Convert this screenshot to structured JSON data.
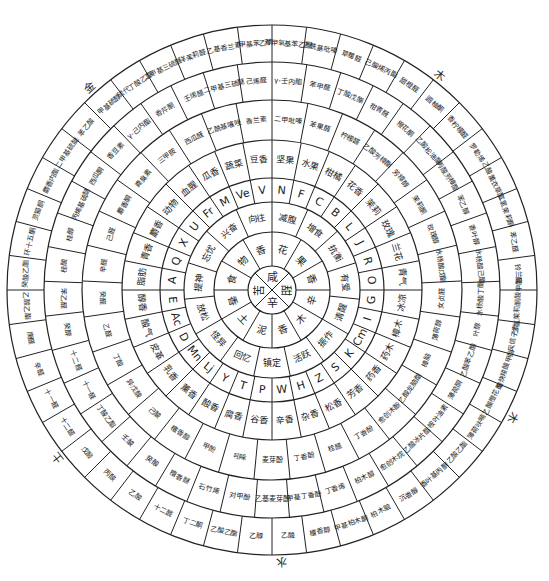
{
  "diagram": {
    "title": "",
    "center": {
      "x": 272,
      "y": 290
    },
    "outer_radius": 265,
    "elements": [
      {
        "label": "木",
        "angle": 38
      },
      {
        "label": "木",
        "angle": 118
      },
      {
        "label": "水",
        "angle": 178
      },
      {
        "label": "土",
        "angle": 232
      },
      {
        "label": "金",
        "angle": 318
      }
    ],
    "ring0_center": [
      "甜",
      "辛",
      "苦",
      "咸"
    ],
    "ring1_categories": [
      "花",
      "果",
      "香",
      "辛",
      "木",
      "香",
      "泥",
      "土",
      "香",
      "食",
      "物",
      "香"
    ],
    "ring2_subcategories": [
      "减腹",
      "增食",
      "抗衡",
      "有爱",
      "清醒",
      "振作",
      "活跃",
      "镇定",
      "回忆",
      "怪异",
      "放松",
      "提神",
      "忘忧",
      "兴奋",
      "向往"
    ],
    "ring3_letters": [
      "N",
      "F",
      "C",
      "B",
      "L",
      "J",
      "R",
      "O",
      "G",
      "I",
      "Cm",
      "K",
      "S",
      "Z",
      "H",
      "W",
      "P",
      "T",
      "Y",
      "Lj",
      "Mn",
      "D",
      "Ac",
      "E",
      "A",
      "Q",
      "X",
      "U",
      "Fr",
      "M",
      "Ve",
      "V"
    ],
    "ring4_groups": [
      "坚果",
      "水果",
      "柑橘",
      "花香",
      "茉莉",
      "玫瑰",
      "兰花",
      "青气",
      "冰凉",
      "樟木",
      "药木",
      "药香",
      "芳香",
      "松香",
      "杂香",
      "辛香",
      "谷香",
      "腐香",
      "酸香",
      "薰香",
      "乳香",
      "皮革",
      "酸气",
      "醇香",
      "脂肪",
      "青香",
      "麝香",
      "动物",
      "血腥",
      "瓜香",
      "蔬菜",
      "豆香"
    ],
    "ring5_compounds": [
      "二甲吡嗪",
      "苯果醛",
      "柠檬醛",
      "乙酸芳樟酯",
      "芳樟醇",
      "茉莉酮",
      "玫瑰醇",
      "水杨酸戊酯",
      "女贞醛",
      "薄荷醇",
      "樟脑",
      "乙酸龙脑酯",
      "愈创木酚",
      "丁香酚",
      "桂醛",
      "丁香酚",
      "麦芽酚",
      "吲哚",
      "甲酚",
      "檀香醇",
      "己酸",
      "异戊酸",
      "丁酸",
      "乙醛",
      "癸醛",
      "辛醛",
      "己醛",
      "麝香酮",
      "粪臭素",
      "三甲胺",
      "西瓜醛",
      "乙酰基噻唑",
      "香兰素"
    ],
    "ring6_compounds": [
      "γ-壬内酯",
      "苯甲醛",
      "丁酸戊酯",
      "柑青醛",
      "橙花酮",
      "乙酸松油酯",
      "丙酸芳樟酯",
      "苯乙醇",
      "香叶醇",
      "水杨酸己酯",
      "水杨酸丁酯",
      "叶醇",
      "乙酸苯乙酯",
      "薄荷酮",
      "桉叶油素",
      "乙酸冰片酯",
      "愈创木烷",
      "柏木醇",
      "丁香烯",
      "甲基丁香酚",
      "乙基麦芽酚",
      "对甲酚",
      "石竹烯",
      "檀香醚",
      "癸酸",
      "壬酸",
      "丁酸乙酯",
      "十一醛",
      "十二醛",
      "癸醇",
      "苯乙醛",
      "桂酸",
      "桂醇",
      "丙烯基硫醚",
      "西瓜酮",
      "香豆素",
      "γ-己内酯",
      "香芹酮",
      "壬烯醛",
      "二甲基三硫醚",
      "己烯醛"
    ],
    "ring7_compounds": [
      "对甲氧基苯乙酮",
      "乙酰基吡嗪",
      "草莓醛",
      "己酸烯丙酯",
      "甜橙醛",
      "圆柚酮",
      "香柠檬醛",
      "罗勒烯",
      "乙酸薰衣草酯",
      "二氢茉莉酮",
      "苯乙醛",
      "铃兰醛",
      "二氢茉莉酮酸甲酯",
      "风信子素",
      "辛炔羧酸甲酯",
      "乙酸橙花酯",
      "薄荷呋喃",
      "乙酸乙酯",
      "香叶基丙酮",
      "沉香醇",
      "柏木脑",
      "甲基柏木酮",
      "檀香醇",
      "乙酸",
      "乙醇",
      "乙酸乙酯",
      "丁二酮",
      "十二醛",
      "乙酸",
      "丙酸",
      "戊酸",
      "十二醛",
      "十一醛",
      "辛醛",
      "庚醛",
      "乙酸乙酯",
      "癸酸乙酯",
      "环十五酮",
      "灵猫酮",
      "麝香内酯",
      "二甲基硫醚",
      "苯乙酸",
      "甲基硫醇",
      "硫代丁酸乙酯",
      "二甲基三硫醚",
      "洋茉莉醛",
      "乙基香兰素",
      "甲基苯乙酮"
    ],
    "legend": []
  }
}
